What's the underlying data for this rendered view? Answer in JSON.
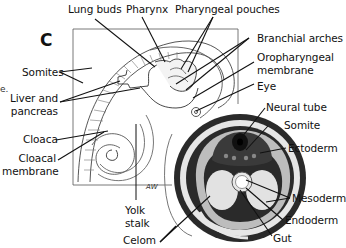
{
  "figure": {
    "panel_letter": "C",
    "left_edge_fragment": "e.",
    "artist_mark": "AW"
  },
  "labels": {
    "lung_buds": "Lung buds",
    "pharynx": "Pharynx",
    "pharyngeal_pouches": "Pharyngeal pouches",
    "branchial_arches": "Branchial arches",
    "oropharyngeal_membrane_1": "Oropharyngeal",
    "oropharyngeal_membrane_2": "membrane",
    "eye": "Eye",
    "somites": "Somites",
    "liver_pancreas_1": "Liver and",
    "liver_pancreas_2": "pancreas",
    "cloaca": "Cloaca",
    "cloacal_membrane_1": "Cloacal",
    "cloacal_membrane_2": "membrane",
    "yolk_stalk_1": "Yolk",
    "yolk_stalk_2": "stalk",
    "celom": "Celom",
    "neural_tube": "Neural tube",
    "somite": "Somite",
    "ectoderm": "Ectoderm",
    "mesoderm": "Mesoderm",
    "endoderm": "Endoderm",
    "gut": "Gut"
  },
  "colors": {
    "line": "#111111",
    "tissue_light": "#e6e6e6",
    "tissue_mid": "#bdbdbd",
    "tissue_dark": "#2a2a2a"
  }
}
